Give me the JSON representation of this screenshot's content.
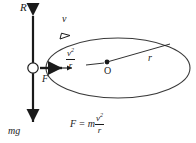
{
  "figure": {
    "type": "physics-free-body-circular-motion-diagram",
    "background_color": "#ffffff",
    "stroke_color": "#1a1a1a"
  },
  "labels": {
    "normal_force": "R",
    "velocity": "v",
    "weight": "mg",
    "force": "F",
    "center": "O",
    "radius": "r"
  },
  "centripetal_expression": {
    "numerator": "v",
    "numerator_exponent": "2",
    "denominator": "r"
  },
  "equation": {
    "lhs": "F",
    "operator": "=",
    "mass": "m",
    "numerator": "v",
    "numerator_exponent": "2",
    "denominator": "r"
  },
  "geometry": {
    "ellipse_center_x": 118,
    "ellipse_center_y": 68,
    "ellipse_rx": 72,
    "ellipse_ry": 30,
    "object_x": 33,
    "object_y": 68,
    "object_radius": 5,
    "vertical_axis_top_y": 12,
    "vertical_axis_bottom_y": 126,
    "center_dot_x": 107,
    "center_dot_y": 62,
    "radius_line_end_x": 160,
    "radius_line_end_y": 43
  }
}
